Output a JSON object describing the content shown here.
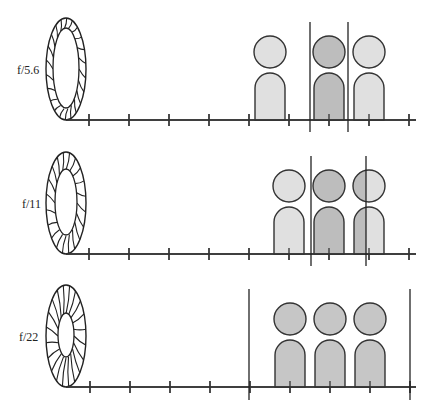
{
  "colors": {
    "out_of_focus": "#e0e0e0",
    "in_focus": "#bdbdbd",
    "all_in_focus": "#c6c6c6",
    "outline": "#333333"
  },
  "panels": [
    {
      "label": "f/5.6",
      "axis_y": 120,
      "lens": {
        "cx": 66,
        "cy": 69,
        "rx": 20,
        "ry": 51,
        "inner_rx": 13,
        "inner_ry": 40,
        "blades": 22
      },
      "ticks": [
        89,
        129,
        169,
        209,
        249,
        289,
        329,
        369,
        409
      ],
      "focus_zone": {
        "x1": 310,
        "x2": 348,
        "y_top": 22,
        "y_bottom": 132
      },
      "people": [
        {
          "cx": 270,
          "fill": "out_of_focus",
          "split_x": null
        },
        {
          "cx": 329,
          "fill": "in_focus",
          "split_x": null
        },
        {
          "cx": 369,
          "fill": "out_of_focus",
          "split_x": null
        }
      ]
    },
    {
      "label": "f/11",
      "axis_y": 254,
      "lens": {
        "cx": 66,
        "cy": 203,
        "rx": 20,
        "ry": 51,
        "inner_rx": 11,
        "inner_ry": 33,
        "blades": 20
      },
      "ticks": [
        89,
        129,
        169,
        209,
        249,
        289,
        329,
        369,
        409
      ],
      "focus_zone": {
        "x1": 311,
        "x2": 366,
        "y_top": 156,
        "y_bottom": 266
      },
      "people": [
        {
          "cx": 289,
          "fill": "out_of_focus",
          "split_x": null
        },
        {
          "cx": 329,
          "fill": "in_focus",
          "split_x": null
        },
        {
          "cx": 369,
          "fill": "out_of_focus",
          "split_x": 366
        }
      ]
    },
    {
      "label": "f/22",
      "axis_y": 387,
      "lens": {
        "cx": 66,
        "cy": 336,
        "rx": 20,
        "ry": 51,
        "inner_rx": 8,
        "inner_ry": 22,
        "blades": 20
      },
      "ticks": [
        90,
        130,
        170,
        210,
        250,
        290,
        330,
        370,
        410
      ],
      "focus_zone": {
        "x1": 249,
        "x2": 410,
        "y_top": 289,
        "y_bottom": 400
      },
      "people": [
        {
          "cx": 290,
          "fill": "all_in_focus",
          "split_x": null
        },
        {
          "cx": 330,
          "fill": "all_in_focus",
          "split_x": null
        },
        {
          "cx": 370,
          "fill": "all_in_focus",
          "split_x": null
        }
      ]
    }
  ]
}
